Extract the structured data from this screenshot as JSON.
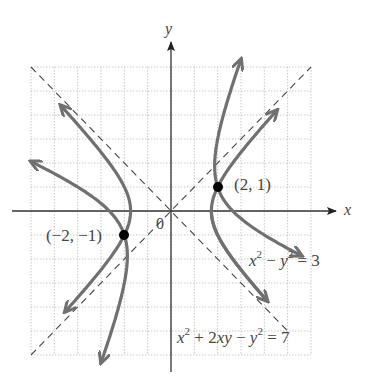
{
  "chart_data": {
    "type": "diagram",
    "title": "",
    "xlabel": "x",
    "ylabel": "y",
    "origin_label": "0",
    "grid": true,
    "xlim": [
      -6,
      6
    ],
    "ylim": [
      -6,
      6
    ],
    "equations": [
      {
        "name": "hyperbola-standard",
        "label_text": "x² − y² = 3",
        "equation": "x^2 - y^2 = 3"
      },
      {
        "name": "hyperbola-rotated",
        "label_text": "x² + 2xy − y² = 7",
        "equation": "x^2 + 2xy - y^2 = 7"
      }
    ],
    "asymptotes": [
      {
        "equation": "y = x",
        "style": "dashed"
      },
      {
        "equation": "y = -x",
        "style": "dashed"
      }
    ],
    "points": [
      {
        "label": "(2, 1)",
        "x": 2,
        "y": 1
      },
      {
        "label": "(−2, −1)",
        "x": -2,
        "y": -1
      }
    ]
  },
  "labels": {
    "x_axis": "x",
    "y_axis": "y",
    "origin": "0",
    "point_a": "(2, 1)",
    "point_b": "(−2, −1)",
    "eq1": {
      "a": "x",
      "e1": "2",
      "b": " − ",
      "c": "y",
      "e2": "2",
      "d": " = 3"
    },
    "eq2": {
      "a": "x",
      "e1": "2",
      "b": " + 2",
      "c": "xy",
      "d": " − ",
      "f": "y",
      "e2": "2",
      "g": " = 7"
    }
  },
  "colors": {
    "curve": "#707070",
    "axis": "#333333",
    "grid": "#c8c8c8",
    "asymptote": "#444444",
    "point": "#000000"
  }
}
